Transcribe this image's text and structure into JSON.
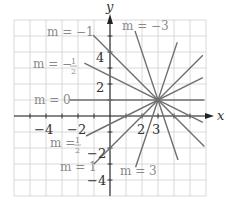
{
  "chart_data": {
    "type": "line",
    "title": "",
    "xlabel": "x",
    "ylabel": "y",
    "xlim": [
      -6,
      6
    ],
    "ylim": [
      -5,
      6
    ],
    "grid": true,
    "common_point": {
      "x": 3,
      "y": 1
    },
    "x_ticks": [
      {
        "value": -4,
        "label": "−4"
      },
      {
        "value": -2,
        "label": "−2"
      },
      {
        "value": 2,
        "label": "2"
      },
      {
        "value": 3,
        "label": "3"
      }
    ],
    "y_ticks": [
      {
        "value": 4,
        "label": "4"
      },
      {
        "value": 2,
        "label": "2"
      },
      {
        "value": -2,
        "label": "−2"
      },
      {
        "value": -4,
        "label": "−4"
      }
    ],
    "series": [
      {
        "name": "m = −3",
        "slope": -3,
        "x_range": [
          1.56,
          4.25
        ]
      },
      {
        "name": "m = −1",
        "slope": -1,
        "x_range": [
          -1.06,
          5.9
        ]
      },
      {
        "name": "m = −½",
        "slope": -0.5,
        "x_range": [
          -1.6,
          5.8
        ]
      },
      {
        "name": "m = 0",
        "slope": 0,
        "x_range": [
          -2.5,
          5.9
        ]
      },
      {
        "name": "m = ½",
        "slope": 0.5,
        "x_range": [
          -1.5,
          5.8
        ]
      },
      {
        "name": "m = 1",
        "slope": 1,
        "x_range": [
          -1.0,
          5.8
        ]
      },
      {
        "name": "m = 3",
        "slope": 3,
        "x_range": [
          1.6,
          4.2
        ]
      }
    ],
    "labels": {
      "m_neg3": "m = −3",
      "m_neg1": "m = −1",
      "m_neghalf_prefix": "m = −",
      "m_zero": "m = 0",
      "m_half_prefix": "m = ",
      "m_one": "m = 1",
      "m_three": "m = 3",
      "half_num": "1",
      "half_den": "2"
    },
    "legend_position": "inline"
  },
  "axes": {
    "x_label": "x",
    "y_label": "y"
  },
  "colors": {
    "grid": "#d0d0d0",
    "axis": "#222222",
    "lines": "#6e6e6e",
    "label_gray": "#8a8a8a"
  }
}
